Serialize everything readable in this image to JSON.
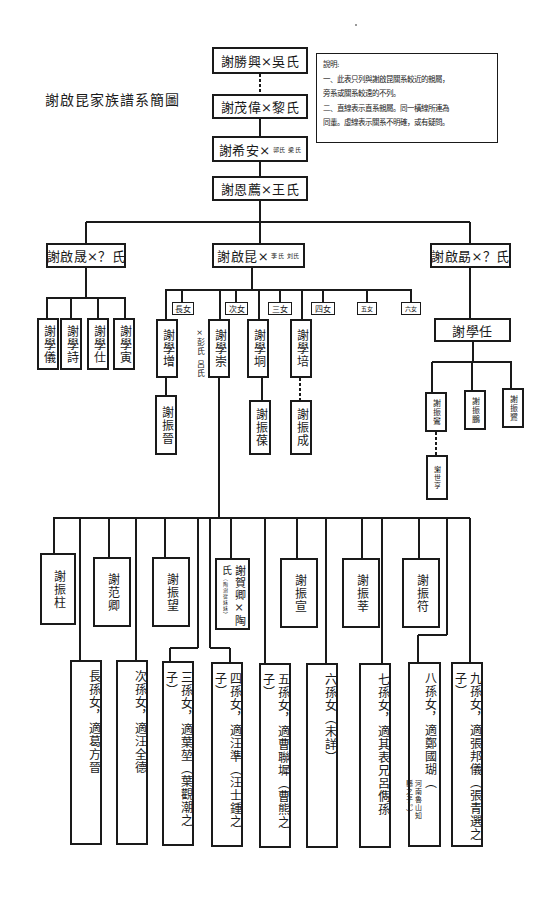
{
  "title": "謝啟昆家族譜系簡圖",
  "notes": {
    "heading": "說明:",
    "lines": [
      "一、此表只列與謝啟昆關系較近的親屬，",
      "旁系或關系較遠的不列。",
      "二、直線表示直系親屬。同一橫線所連為",
      "同輩。虛線表示關系不明確，或有疑問。"
    ]
  },
  "ancestors": [
    {
      "name": "謝勝興×吳氏",
      "spouse_small": ""
    },
    {
      "name": "謝茂偉×黎氏",
      "spouse_small": ""
    },
    {
      "name": "謝希安×",
      "spouse_small": "郭氏 梁氏"
    },
    {
      "name": "謝恩薦×王氏",
      "spouse_small": ""
    }
  ],
  "generation_brothers": {
    "left": {
      "name": "謝啟晟×？氏"
    },
    "center": {
      "name": "謝啟昆×",
      "spouse_small": "李氏 刘氏"
    },
    "right": {
      "name": "謝啟勗×？氏"
    }
  },
  "left_sons": [
    "謝學儀",
    "謝學詩",
    "謝學仕",
    "謝學寅"
  ],
  "center_children": {
    "daughters": [
      "長女",
      "次女",
      "三女",
      "四女",
      "五女",
      "六女"
    ],
    "sons": [
      "謝學增",
      "謝學崇",
      "謝學垌",
      "謝學培"
    ],
    "spouse_note": "×彭氏 呂氏",
    "grandsons_upper": [
      "謝振晉",
      "謝振葆",
      "謝振成"
    ]
  },
  "right_branch": {
    "son": "謝學任",
    "grandsons": [
      "謝振鸞",
      "謝振鵬",
      "謝振鷺"
    ],
    "great_grandson": "謝世亨"
  },
  "grandsons": [
    {
      "name": "謝振柱",
      "sub": ""
    },
    {
      "name": "謝范卿",
      "sub": ""
    },
    {
      "name": "謝振望",
      "sub": ""
    },
    {
      "name": "謝賀卿×陶",
      "side": "氏",
      "sub": "（陶澍從妹妹）"
    },
    {
      "name": "謝振宣",
      "sub": ""
    },
    {
      "name": "謝振莘",
      "sub": ""
    },
    {
      "name": "謝振符",
      "sub": ""
    }
  ],
  "granddaughters": [
    "長孫女，適葛方晉",
    "次孫女，適汪全德",
    "三孫女，適葉堃（葉觀潮之子）",
    "四孫女，適汪準（汪士鍾之子）",
    "五孫女，適曹聯墀（曹熊之子）",
    "六孫女（未詳）",
    "七孫女，適其表兄呂儁孫",
    "八孫女，適鄭國瑚（",
    "九孫女，適張邦儀（張青選之子）"
  ],
  "granddaughter8_note": [
    "河南魯山知",
    "縣之子。）"
  ]
}
